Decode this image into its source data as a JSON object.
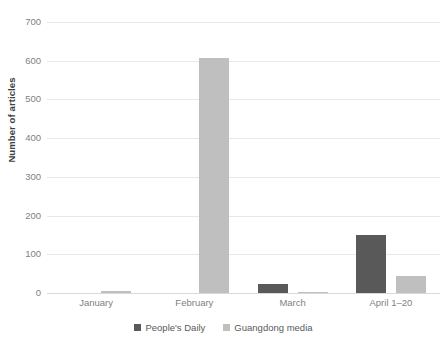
{
  "chart_data": {
    "type": "bar",
    "title": "",
    "subtitle": "",
    "xlabel": "",
    "ylabel": "Number of articles",
    "categories": [
      "January",
      "February",
      "March",
      "April 1–20"
    ],
    "series": [
      {
        "name": "People's Daily",
        "color": "#595959",
        "values": [
          0,
          0,
          22,
          150
        ]
      },
      {
        "name": "Guangdong media",
        "color": "#bfbfbf",
        "values": [
          5,
          607,
          3,
          45
        ]
      }
    ],
    "ylim": [
      0,
      700
    ],
    "ytick_labels": [
      "700",
      "600",
      "500",
      "400",
      "300",
      "200",
      "100",
      "0"
    ],
    "ytick_values": [
      700,
      600,
      500,
      400,
      300,
      200,
      100,
      0
    ],
    "grid": true,
    "legend_position": "bottom"
  },
  "axis": {
    "y_title": "Number of articles"
  },
  "legend": {
    "items": [
      {
        "label": "People's Daily",
        "color": "#595959"
      },
      {
        "label": "Guangdong media",
        "color": "#bfbfbf"
      }
    ]
  },
  "colors": {
    "series_peoples_daily": "#595959",
    "series_guangdong_media": "#bfbfbf",
    "gridline": "#e8e8e8",
    "tick_text": "#7f7f7f",
    "background": "#ffffff"
  }
}
